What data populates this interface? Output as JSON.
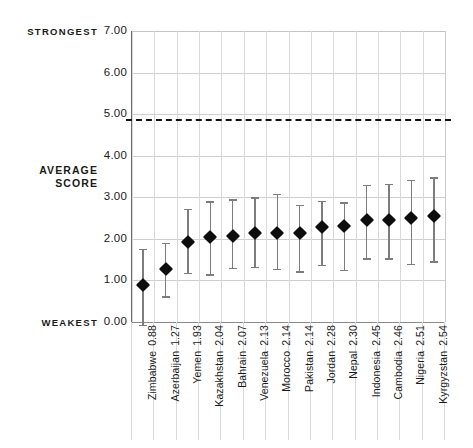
{
  "chart_data": {
    "type": "scatter",
    "title": "",
    "subtitle": "",
    "xlabel": "",
    "ylabel": "AVERAGE SCORE",
    "ylim": [
      0.0,
      7.0
    ],
    "ytick_labels": [
      "7.00",
      "6.00",
      "5.00",
      "4.00",
      "3.00",
      "2.00",
      "1.00",
      "0.00"
    ],
    "ytick_values": [
      7,
      6,
      5,
      4,
      3,
      2,
      1,
      0
    ],
    "grid": "both",
    "legend": "none",
    "axis_top_caption": "STRONGEST",
    "axis_bottom_caption": "WEAKEST",
    "axis_mid_caption_line1": "AVERAGE",
    "axis_mid_caption_line2": "SCORE",
    "reference_line": {
      "value": 4.88,
      "style": "dashed",
      "color": "#121212",
      "label": ""
    },
    "categories": [
      "Zimbabwe",
      "Azerbaijan",
      "Yemen",
      "Kazakhstan",
      "Bahrain",
      "Venezuela",
      "Morocco",
      "Pakistan",
      "Jordan",
      "Nepal",
      "Indonesia",
      "Cambodia",
      "Nigeria",
      "Kyrgyzstan"
    ],
    "values": [
      0.88,
      1.27,
      1.93,
      2.04,
      2.07,
      2.13,
      2.14,
      2.14,
      2.28,
      2.3,
      2.45,
      2.46,
      2.51,
      2.54
    ],
    "value_labels": [
      "0.88",
      "1.27",
      "1.93",
      "2.04",
      "2.07",
      "2.13",
      "2.14",
      "2.14",
      "2.28",
      "2.30",
      "2.45",
      "2.46",
      "2.51",
      "2.54"
    ],
    "error_low": [
      -0.07,
      0.62,
      1.18,
      1.15,
      1.3,
      1.33,
      1.28,
      1.22,
      1.38,
      1.25,
      1.53,
      1.53,
      1.4,
      1.46
    ],
    "error_high": [
      1.76,
      1.9,
      2.73,
      2.9,
      2.95,
      3.0,
      3.08,
      2.82,
      2.92,
      2.88,
      3.3,
      3.32,
      3.42,
      3.48
    ],
    "points": [
      {
        "category": "Zimbabwe",
        "value": 0.88,
        "low": -0.07,
        "high": 1.76
      },
      {
        "category": "Azerbaijan",
        "value": 1.27,
        "low": 0.62,
        "high": 1.9
      },
      {
        "category": "Yemen",
        "value": 1.93,
        "low": 1.18,
        "high": 2.73
      },
      {
        "category": "Kazakhstan",
        "value": 2.04,
        "low": 1.15,
        "high": 2.9
      },
      {
        "category": "Bahrain",
        "value": 2.07,
        "low": 1.3,
        "high": 2.95
      },
      {
        "category": "Venezuela",
        "value": 2.13,
        "low": 1.33,
        "high": 3.0
      },
      {
        "category": "Morocco",
        "value": 2.14,
        "low": 1.28,
        "high": 3.08
      },
      {
        "category": "Pakistan",
        "value": 2.14,
        "low": 1.22,
        "high": 2.82
      },
      {
        "category": "Jordan",
        "value": 2.28,
        "low": 1.38,
        "high": 2.92
      },
      {
        "category": "Nepal",
        "value": 2.3,
        "low": 1.25,
        "high": 2.88
      },
      {
        "category": "Indonesia",
        "value": 2.45,
        "low": 1.53,
        "high": 3.3
      },
      {
        "category": "Cambodia",
        "value": 2.46,
        "low": 1.53,
        "high": 3.32
      },
      {
        "category": "Nigeria",
        "value": 2.51,
        "low": 1.4,
        "high": 3.42
      },
      {
        "category": "Kyrgyzstan",
        "value": 2.54,
        "low": 1.46,
        "high": 3.48
      }
    ],
    "colors": {
      "marker": "#0d0d0d",
      "whisker": "#7d7d7d",
      "grid": "#d9d9d9",
      "axis": "#6b6b6b",
      "reference": "#121212",
      "background": "#ffffff"
    }
  }
}
